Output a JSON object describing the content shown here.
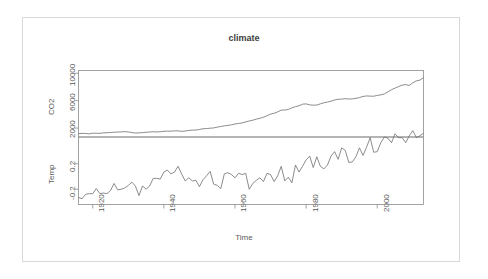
{
  "chart_data": {
    "type": "line",
    "title": "climate",
    "xlabel": "Time",
    "grid": false,
    "legend": "none",
    "layout": "two stacked panels sharing one x axis (R plot.ts style)",
    "xlim": [
      1916,
      2013
    ],
    "xticks": [
      1920,
      1940,
      1960,
      1980,
      2000
    ],
    "xtick_labels": [
      "1920",
      "1940",
      "1960",
      "1980",
      "2000"
    ],
    "panels": [
      {
        "name": "CO2",
        "ylabel": "CO2",
        "yticks": [
          2000,
          6000,
          10000
        ],
        "ytick_labels": [
          "2000",
          "6000",
          "10000"
        ],
        "ylim": [
          700,
          10400
        ],
        "x": [
          1916,
          1917,
          1918,
          1919,
          1920,
          1921,
          1922,
          1923,
          1924,
          1925,
          1926,
          1927,
          1928,
          1929,
          1930,
          1931,
          1932,
          1933,
          1934,
          1935,
          1936,
          1937,
          1938,
          1939,
          1940,
          1941,
          1942,
          1943,
          1944,
          1945,
          1946,
          1947,
          1948,
          1949,
          1950,
          1951,
          1952,
          1953,
          1954,
          1955,
          1956,
          1957,
          1958,
          1959,
          1960,
          1961,
          1962,
          1963,
          1964,
          1965,
          1966,
          1967,
          1968,
          1969,
          1970,
          1971,
          1972,
          1973,
          1974,
          1975,
          1976,
          1977,
          1978,
          1979,
          1980,
          1981,
          1982,
          1983,
          1984,
          1985,
          1986,
          1987,
          1988,
          1989,
          1990,
          1991,
          1992,
          1993,
          1994,
          1995,
          1996,
          1997,
          1998,
          1999,
          2000,
          2001,
          2002,
          2003,
          2004,
          2005,
          2006,
          2007,
          2008,
          2009,
          2010,
          2011,
          2012,
          2013
        ],
        "values": [
          1180,
          1230,
          1215,
          1150,
          1260,
          1240,
          1235,
          1300,
          1330,
          1355,
          1400,
          1420,
          1445,
          1480,
          1440,
          1345,
          1280,
          1300,
          1340,
          1390,
          1430,
          1470,
          1440,
          1470,
          1530,
          1560,
          1555,
          1590,
          1600,
          1520,
          1575,
          1660,
          1705,
          1710,
          1800,
          1905,
          1930,
          1985,
          2020,
          2135,
          2235,
          2325,
          2390,
          2480,
          2600,
          2680,
          2755,
          2900,
          3040,
          3150,
          3310,
          3425,
          3590,
          3805,
          4045,
          4160,
          4360,
          4620,
          4635,
          4720,
          4960,
          5120,
          5255,
          5490,
          5530,
          5390,
          5345,
          5355,
          5540,
          5690,
          5800,
          5930,
          6100,
          6200,
          6230,
          6290,
          6240,
          6260,
          6335,
          6450,
          6615,
          6690,
          6660,
          6650,
          6760,
          6845,
          6985,
          7290,
          7595,
          7830,
          8060,
          8260,
          8350,
          8215,
          8610,
          8890,
          9000,
          9340
        ]
      },
      {
        "name": "Temp",
        "ylabel": "Temp",
        "yticks": [
          -0.2,
          0.2
        ],
        "ytick_labels": [
          "-0.2",
          "0.2"
        ],
        "ylim": [
          -0.44,
          0.62
        ],
        "x": [
          1916,
          1917,
          1918,
          1919,
          1920,
          1921,
          1922,
          1923,
          1924,
          1925,
          1926,
          1927,
          1928,
          1929,
          1930,
          1931,
          1932,
          1933,
          1934,
          1935,
          1936,
          1937,
          1938,
          1939,
          1940,
          1941,
          1942,
          1943,
          1944,
          1945,
          1946,
          1947,
          1948,
          1949,
          1950,
          1951,
          1952,
          1953,
          1954,
          1955,
          1956,
          1957,
          1958,
          1959,
          1960,
          1961,
          1962,
          1963,
          1964,
          1965,
          1966,
          1967,
          1968,
          1969,
          1970,
          1971,
          1972,
          1973,
          1974,
          1975,
          1976,
          1977,
          1978,
          1979,
          1980,
          1981,
          1982,
          1983,
          1984,
          1985,
          1986,
          1987,
          1988,
          1989,
          1990,
          1991,
          1992,
          1993,
          1994,
          1995,
          1996,
          1997,
          1998,
          1999,
          2000,
          2001,
          2002,
          2003,
          2004,
          2005,
          2006,
          2007,
          2008,
          2009,
          2010,
          2011,
          2012,
          2013
        ],
        "values": [
          -0.33,
          -0.35,
          -0.28,
          -0.27,
          -0.27,
          -0.19,
          -0.27,
          -0.26,
          -0.27,
          -0.22,
          -0.11,
          -0.21,
          -0.2,
          -0.18,
          -0.14,
          -0.09,
          -0.15,
          -0.3,
          -0.15,
          -0.2,
          -0.15,
          -0.03,
          -0.03,
          -0.04,
          0.07,
          0.1,
          0.04,
          0.07,
          0.16,
          0.04,
          -0.07,
          -0.02,
          -0.07,
          -0.06,
          -0.16,
          -0.05,
          0.01,
          0.08,
          -0.12,
          -0.14,
          -0.19,
          0.04,
          0.06,
          0.03,
          -0.02,
          0.05,
          0.03,
          0.05,
          -0.2,
          -0.11,
          -0.06,
          -0.02,
          -0.08,
          0.05,
          0.03,
          -0.08,
          0.01,
          0.16,
          -0.07,
          -0.01,
          -0.1,
          0.18,
          0.07,
          0.16,
          0.26,
          0.32,
          0.14,
          0.31,
          0.16,
          0.12,
          0.18,
          0.32,
          0.39,
          0.27,
          0.45,
          0.41,
          0.22,
          0.23,
          0.31,
          0.45,
          0.33,
          0.46,
          0.61,
          0.38,
          0.39,
          0.53,
          0.62,
          0.6,
          0.53,
          0.67,
          0.61,
          0.61,
          0.53,
          0.64,
          0.72,
          0.61,
          0.64,
          0.68
        ]
      }
    ]
  }
}
